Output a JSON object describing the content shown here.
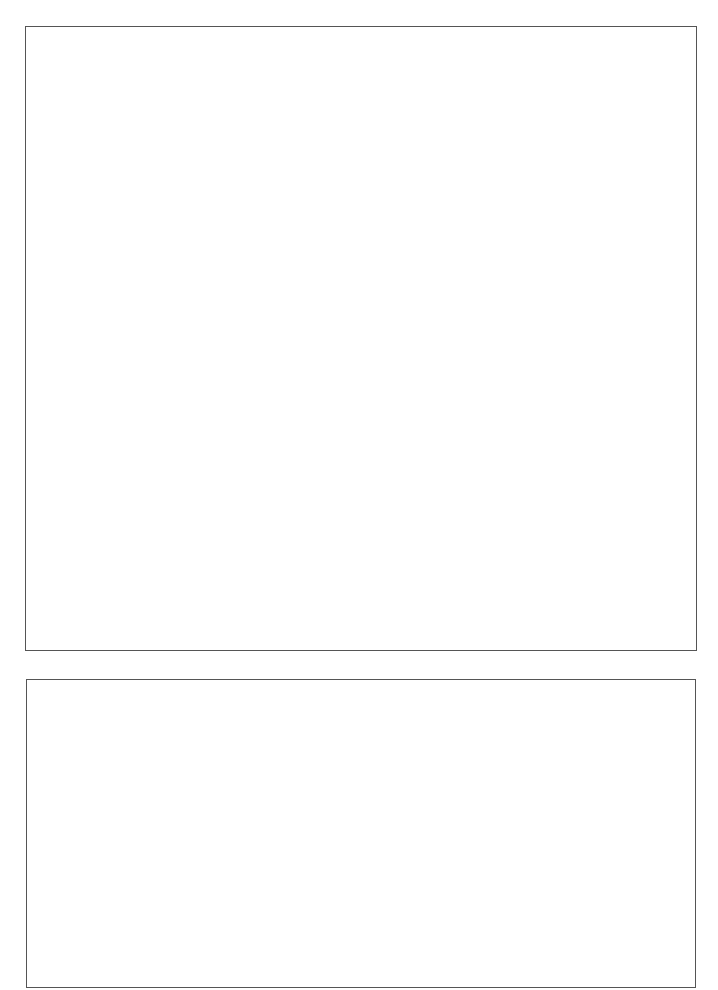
{
  "page": {
    "background": "#ffffff",
    "border_color": "#555555"
  },
  "panels": [
    {
      "id": "top",
      "content": ""
    },
    {
      "id": "bottom",
      "content": ""
    }
  ]
}
